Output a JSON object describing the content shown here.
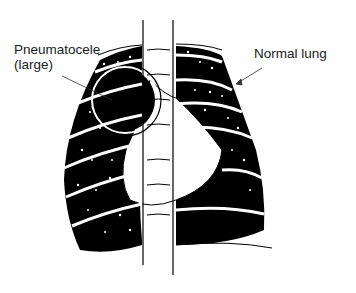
{
  "figure": {
    "type": "anatomical-diagram",
    "background_color": "#ffffff",
    "ink_color": "#000000"
  },
  "labels": {
    "pneumatocele_line1": "Pneumatocele",
    "pneumatocele_line2": "(large)",
    "normal_lung": "Normal lung"
  }
}
